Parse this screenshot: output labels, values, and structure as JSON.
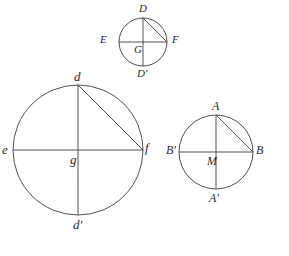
{
  "figure": {
    "kind": "geometry-diagram",
    "background_color": "#ffffff",
    "stroke_color": "#3c3c3c",
    "label_color": "#2b2b2b"
  },
  "circles": [
    {
      "id": "top-circle",
      "center": {
        "x": 143,
        "y": 42,
        "label": "G"
      },
      "radius": 24,
      "label_size": "lbl-small",
      "points": [
        {
          "name": "top",
          "label": "D",
          "x": 143,
          "y": 18,
          "lx": 139,
          "ly": 3
        },
        {
          "name": "left",
          "label": "E",
          "x": 119,
          "y": 42,
          "lx": 100,
          "ly": 34
        },
        {
          "name": "right",
          "label": "F",
          "x": 167,
          "y": 42,
          "lx": 172,
          "ly": 34
        },
        {
          "name": "bottom",
          "label": "D'",
          "x": 143,
          "y": 66,
          "lx": 137,
          "ly": 68
        },
        {
          "name": "center",
          "label": "G",
          "x": 143,
          "y": 42,
          "lx": 134,
          "ly": 44
        }
      ],
      "chord": {
        "from": "top",
        "to": "right"
      }
    },
    {
      "id": "bottom-left-circle",
      "center": {
        "x": 78,
        "y": 150,
        "label": "g"
      },
      "radius": 65,
      "label_size": "lbl-big",
      "points": [
        {
          "name": "top",
          "label": "d",
          "x": 78,
          "y": 85,
          "lx": 74,
          "ly": 70
        },
        {
          "name": "left",
          "label": "e",
          "x": 13,
          "y": 150,
          "lx": 2,
          "ly": 143
        },
        {
          "name": "right",
          "label": "f",
          "x": 143,
          "y": 150,
          "lx": 145,
          "ly": 141
        },
        {
          "name": "bottom",
          "label": "d'",
          "x": 78,
          "y": 215,
          "lx": 73,
          "ly": 218
        },
        {
          "name": "center",
          "label": "g",
          "x": 78,
          "y": 150,
          "lx": 70,
          "ly": 153
        }
      ],
      "chord": {
        "from": "top",
        "to": "right"
      }
    },
    {
      "id": "bottom-right-circle",
      "center": {
        "x": 216,
        "y": 152,
        "label": "M"
      },
      "radius": 37,
      "label_size": "lbl-med",
      "points": [
        {
          "name": "top",
          "label": "A",
          "x": 216,
          "y": 115,
          "lx": 212,
          "ly": 100
        },
        {
          "name": "left",
          "label": "B'",
          "x": 179,
          "y": 152,
          "lx": 166,
          "ly": 144
        },
        {
          "name": "right",
          "label": "B",
          "x": 253,
          "y": 152,
          "lx": 256,
          "ly": 144
        },
        {
          "name": "bottom",
          "label": "A'",
          "x": 216,
          "y": 189,
          "lx": 209,
          "ly": 192
        },
        {
          "name": "center",
          "label": "M",
          "x": 216,
          "y": 152,
          "lx": 207,
          "ly": 155
        }
      ],
      "chord": {
        "from": "top",
        "to": "right"
      }
    }
  ]
}
